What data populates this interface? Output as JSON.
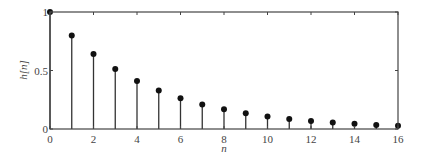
{
  "chart_data": {
    "type": "stem",
    "title": "",
    "xlabel": "n",
    "ylabel": "h[n]",
    "xlim": [
      0,
      16
    ],
    "ylim": [
      0,
      1
    ],
    "xticks": [
      0,
      2,
      4,
      6,
      8,
      10,
      12,
      14,
      16
    ],
    "yticks": [
      0,
      0.5,
      1
    ],
    "xtick_labels": [
      "0",
      "2",
      "4",
      "6",
      "8",
      "10",
      "12",
      "14",
      "16"
    ],
    "ytick_labels": [
      "0",
      "0.5",
      "1"
    ],
    "grid": false,
    "x": [
      0,
      1,
      2,
      3,
      4,
      5,
      6,
      7,
      8,
      9,
      10,
      11,
      12,
      13,
      14,
      15,
      16
    ],
    "values": [
      1.0,
      0.8,
      0.64,
      0.512,
      0.41,
      0.328,
      0.262,
      0.21,
      0.168,
      0.134,
      0.107,
      0.086,
      0.069,
      0.055,
      0.044,
      0.035,
      0.028
    ],
    "colors": {
      "stem": "#333333",
      "marker": "#111111",
      "axis": "#444444"
    }
  }
}
